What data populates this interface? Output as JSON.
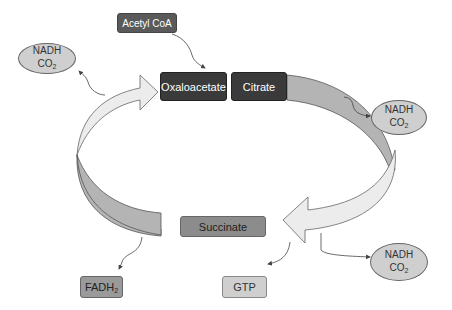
{
  "input": {
    "label": "Acetyl CoA"
  },
  "cycle_nodes": {
    "oxaloacetate": "Oxaloacetate",
    "citrate": "Citrate",
    "succinate": "Succinate"
  },
  "products": {
    "nadh_top_left": {
      "line1": "NADH",
      "line2_base": "CO",
      "line2_sub": "2"
    },
    "nadh_right_top": {
      "line1": "NADH",
      "line2_base": "CO",
      "line2_sub": "2"
    },
    "nadh_right_bottom": {
      "line1": "NADH",
      "line2_base": "CO",
      "line2_sub": "2"
    },
    "fadh2": {
      "base": "FADH",
      "sub": "2"
    },
    "gtp": {
      "label": "GTP"
    }
  },
  "colors": {
    "dark_node": "#3a3a3a",
    "acetyl_node": "#5a5a5a",
    "succinate_node": "#8c8c8c",
    "fadh2_node": "#9a9a9a",
    "gtp_node": "#cfcfcf",
    "oval_fill": "#cfcfcf",
    "light_arrow": "#ececec",
    "dark_arc": "#b4b4b4"
  }
}
